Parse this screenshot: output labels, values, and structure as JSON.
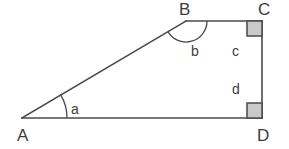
{
  "figure": {
    "canvas": {
      "width": 289,
      "height": 149
    },
    "colors": {
      "stroke": "#4a4a4a",
      "text": "#3c3c3c",
      "right_angle_fill": "#c9c9c9",
      "background": "#ffffff"
    }
  },
  "vertices": [
    {
      "id": "A",
      "label": "A",
      "x": 22,
      "y": 118,
      "label_x": 17,
      "label_y": 141
    },
    {
      "id": "B",
      "label": "B",
      "x": 186,
      "y": 21,
      "label_x": 179,
      "label_y": 15
    },
    {
      "id": "C",
      "label": "C",
      "x": 262,
      "y": 21,
      "label_x": 258,
      "label_y": 15
    },
    {
      "id": "D",
      "label": "D",
      "x": 262,
      "y": 118,
      "label_x": 257,
      "label_y": 141
    }
  ],
  "edges": [
    {
      "id": "AB",
      "from": "A",
      "to": "B",
      "name": "hypotenuse-ab"
    },
    {
      "id": "BC",
      "from": "B",
      "to": "C",
      "name": "top-edge-bc"
    },
    {
      "id": "CD",
      "from": "C",
      "to": "D",
      "name": "right-edge-cd"
    },
    {
      "id": "AD",
      "from": "A",
      "to": "D",
      "name": "base-edge-ad"
    }
  ],
  "angle_marks": [
    {
      "id": "alpha-at-A",
      "label": "a",
      "vertex": "A",
      "radius": 45,
      "label_x": 71,
      "label_y": 114
    },
    {
      "id": "b-at-B",
      "label": "b",
      "vertex": "B",
      "radius": 21,
      "label_x": 191,
      "label_y": 56
    }
  ],
  "segment_labels": [
    {
      "id": "c",
      "label": "c",
      "x": 232,
      "y": 56,
      "describes": "upper part of right edge CD"
    },
    {
      "id": "d",
      "label": "d",
      "x": 232,
      "y": 94,
      "describes": "lower part of right edge CD"
    }
  ],
  "right_angles": [
    {
      "id": "right-angle-C",
      "at": "C",
      "x": 247,
      "y": 21,
      "size": 15,
      "corner": "top-right"
    },
    {
      "id": "right-angle-D",
      "at": "D",
      "x": 247,
      "y": 103,
      "size": 15,
      "corner": "bottom-right"
    }
  ]
}
